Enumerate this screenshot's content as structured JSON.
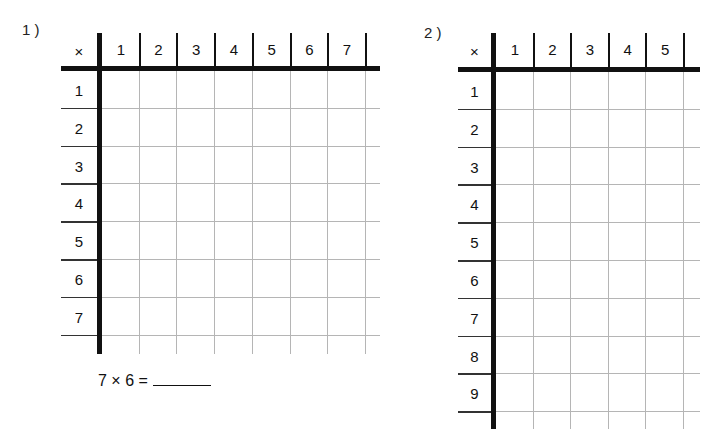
{
  "worksheet": {
    "problems": [
      {
        "number_label": "1 )",
        "corner_symbol": "×",
        "column_headers": [
          "1",
          "2",
          "3",
          "4",
          "5",
          "6",
          "7"
        ],
        "row_headers": [
          "1",
          "2",
          "3",
          "4",
          "5",
          "6",
          "7"
        ],
        "question": {
          "text": "7 × 6 =",
          "answer": ""
        }
      },
      {
        "number_label": "2 )",
        "corner_symbol": "×",
        "column_headers": [
          "1",
          "2",
          "3",
          "4",
          "5"
        ],
        "row_headers": [
          "1",
          "2",
          "3",
          "4",
          "5",
          "6",
          "7",
          "8",
          "9"
        ]
      }
    ]
  },
  "colors": {
    "ink": "#111111",
    "grid": "#b5b5b5",
    "paper": "#ffffff"
  }
}
